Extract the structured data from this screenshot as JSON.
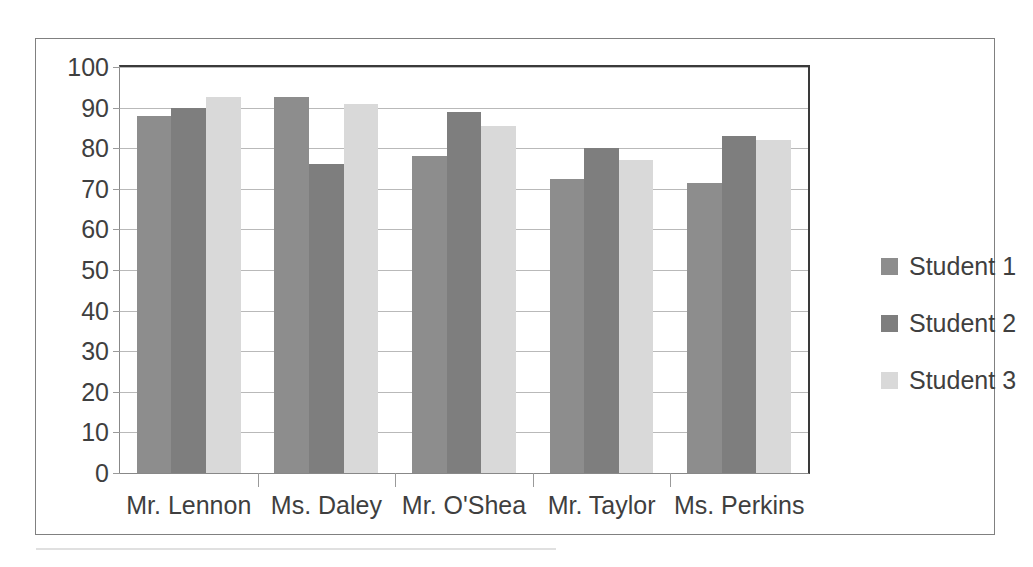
{
  "chart_data": {
    "type": "bar",
    "title": "",
    "subtitle": "",
    "xlabel": "",
    "ylabel": "",
    "ylim": [
      0,
      100
    ],
    "ytick_step": 10,
    "yticks": [
      100,
      90,
      80,
      70,
      60,
      50,
      40,
      30,
      20,
      10,
      0
    ],
    "grid": true,
    "legend_position": "right",
    "categories": [
      "Mr. Lennon",
      "Ms. Daley",
      "Mr. O'Shea",
      "Mr. Taylor",
      "Ms. Perkins"
    ],
    "series": [
      {
        "name": "Student 1",
        "color": "#8d8d8d",
        "values": [
          88,
          92.5,
          78,
          72.5,
          71.5
        ]
      },
      {
        "name": "Student 2",
        "color": "#7e7e7e",
        "values": [
          90,
          76,
          89,
          80,
          83
        ]
      },
      {
        "name": "Student 3",
        "color": "#d9d9d9",
        "values": [
          92.5,
          91,
          85.5,
          77,
          82
        ]
      }
    ]
  },
  "legend": {
    "items": [
      {
        "label": "Student 1",
        "color": "#8d8d8d"
      },
      {
        "label": "Student 2",
        "color": "#7e7e7e"
      },
      {
        "label": "Student 3",
        "color": "#d9d9d9"
      }
    ]
  }
}
